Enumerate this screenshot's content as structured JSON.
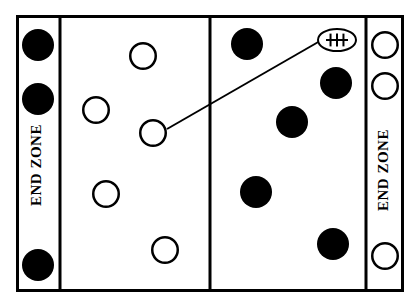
{
  "diagram": {
    "field": {
      "outline": {
        "x": 16,
        "y": 15,
        "width": 388,
        "height": 277
      },
      "border_color": "#000000",
      "border_width": 3,
      "background_color": "#ffffff",
      "lines": [
        {
          "name": "left-endzone-line",
          "x": 60,
          "y1": 15,
          "y2": 292,
          "width": 3
        },
        {
          "name": "midfield-line",
          "x": 210,
          "y1": 15,
          "y2": 292,
          "width": 3
        },
        {
          "name": "right-endzone-line",
          "x": 366,
          "y1": 15,
          "y2": 292,
          "width": 3
        }
      ]
    },
    "endzones": [
      {
        "name": "left-endzone",
        "label": "END ZONE",
        "cx": 38,
        "cy": 165,
        "rotation": -90
      },
      {
        "name": "right-endzone",
        "label": "END ZONE",
        "cx": 385,
        "cy": 170,
        "rotation": -90
      }
    ],
    "legend_colors": {
      "filled_player": "#000000",
      "open_player_stroke": "#000000",
      "open_player_fill": "#ffffff",
      "route_line": "#000000",
      "ball": "#000000"
    },
    "players": [
      {
        "id": "D1",
        "team": "dark",
        "type": "filled",
        "cx": 38,
        "cy": 45,
        "r": 16,
        "zone": "left-endzone"
      },
      {
        "id": "D2",
        "team": "dark",
        "type": "filled",
        "cx": 38,
        "cy": 99,
        "r": 16,
        "zone": "left-endzone"
      },
      {
        "id": "D3",
        "team": "dark",
        "type": "filled",
        "cx": 38,
        "cy": 265,
        "r": 16,
        "zone": "left-endzone"
      },
      {
        "id": "O1",
        "team": "open",
        "type": "open",
        "cx": 143,
        "cy": 56,
        "r": 14,
        "zone": "left-half"
      },
      {
        "id": "O2",
        "team": "open",
        "type": "open",
        "cx": 96,
        "cy": 110,
        "r": 14,
        "zone": "left-half"
      },
      {
        "id": "O3",
        "team": "open",
        "type": "open",
        "cx": 153,
        "cy": 133,
        "r": 14,
        "zone": "left-half"
      },
      {
        "id": "O4",
        "team": "open",
        "type": "open",
        "cx": 106,
        "cy": 194,
        "r": 14,
        "zone": "left-half"
      },
      {
        "id": "O5",
        "team": "open",
        "type": "open",
        "cx": 165,
        "cy": 250,
        "r": 14,
        "zone": "left-half"
      },
      {
        "id": "D4",
        "team": "dark",
        "type": "filled",
        "cx": 247,
        "cy": 44,
        "r": 16,
        "zone": "right-half"
      },
      {
        "id": "D5",
        "team": "dark",
        "type": "filled",
        "cx": 336,
        "cy": 83,
        "r": 16,
        "zone": "right-half"
      },
      {
        "id": "D6",
        "team": "dark",
        "type": "filled",
        "cx": 292,
        "cy": 122,
        "r": 16,
        "zone": "right-half"
      },
      {
        "id": "D7",
        "team": "dark",
        "type": "filled",
        "cx": 256,
        "cy": 192,
        "r": 16,
        "zone": "right-half"
      },
      {
        "id": "D8",
        "team": "dark",
        "type": "filled",
        "cx": 333,
        "cy": 244,
        "r": 16,
        "zone": "right-half"
      },
      {
        "id": "O6",
        "team": "open",
        "type": "open",
        "cx": 385,
        "cy": 45,
        "r": 14,
        "zone": "right-endzone"
      },
      {
        "id": "O7",
        "team": "open",
        "type": "open",
        "cx": 385,
        "cy": 86,
        "r": 14,
        "zone": "right-endzone"
      },
      {
        "id": "O8",
        "team": "open",
        "type": "open",
        "cx": 385,
        "cy": 256,
        "r": 14,
        "zone": "right-endzone"
      }
    ],
    "route": {
      "name": "pass-trajectory",
      "x1": 167,
      "y1": 129,
      "x2": 320,
      "y2": 41,
      "width": 2
    },
    "ball": {
      "name": "football",
      "cx": 337,
      "cy": 40,
      "rx": 19,
      "ry": 11,
      "stroke_width": 2,
      "lace_count": 3
    }
  }
}
